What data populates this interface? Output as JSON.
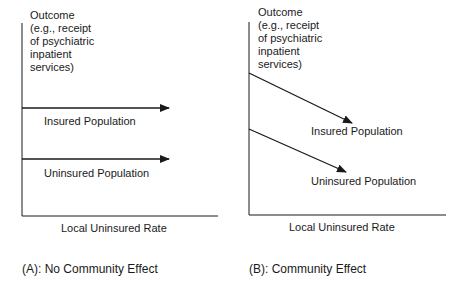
{
  "panels": [
    {
      "id": "A",
      "y_axis_label": [
        "Outcome",
        "(e.g., receipt",
        "of psychiatric",
        "inpatient",
        "services)"
      ],
      "x_axis_label": "Local Uninsured Rate",
      "series": [
        {
          "name": "Insured Population",
          "trend": "flat"
        },
        {
          "name": "Uninsured Population",
          "trend": "flat"
        }
      ],
      "caption": "(A): No Community Effect"
    },
    {
      "id": "B",
      "y_axis_label": [
        "Outcome",
        "(e.g., receipt",
        "of psychiatric",
        "inpatient",
        "services)"
      ],
      "x_axis_label": "Local Uninsured Rate",
      "series": [
        {
          "name": "Insured Population",
          "trend": "decreasing"
        },
        {
          "name": "Uninsured Population",
          "trend": "decreasing"
        }
      ],
      "caption": "(B): Community Effect"
    }
  ],
  "colors": {
    "line": "#1a1a1a",
    "background": "#ffffff"
  }
}
